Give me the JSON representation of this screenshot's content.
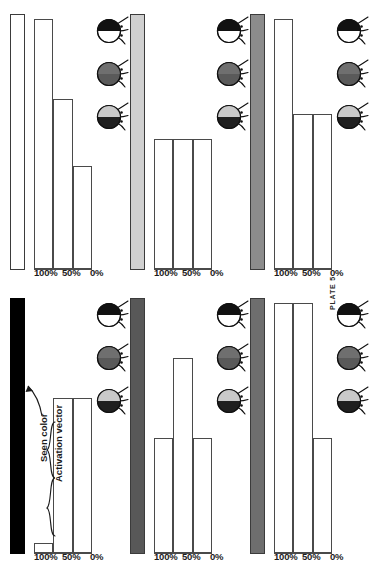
{
  "figure": {
    "caption": "PLATE 5",
    "axis_ticks": [
      "100%",
      "50%",
      "0%"
    ],
    "annotations": {
      "seen_color": "Seen color",
      "activation_vector": "Activation vector"
    },
    "colors": {
      "white": "#ffffff",
      "light_gray": "#d0d0d0",
      "black": "#000000",
      "mid_gray_light": "#8c8c8c",
      "mid_gray_dark": "#6e6e6e",
      "dark_gray": "#585858",
      "outline": "#4a4a4a",
      "bee_dark": "#4a4a4a",
      "bee_mid": "#9a9a9a",
      "bee_light": "#c9c9c9"
    }
  },
  "chart_data": {
    "type": "bar",
    "title": "PLATE 5",
    "xlabel": "",
    "ylabel": "",
    "ylim": [
      0,
      100
    ],
    "grid": false,
    "legend": "none",
    "tick_labels": [
      "100%",
      "50%",
      "0%"
    ],
    "tick_values": [
      100,
      50,
      0
    ],
    "categories": [
      "receptor-1",
      "receptor-2",
      "receptor-3"
    ],
    "panels": [
      {
        "id": "panel-top-left",
        "row": 0,
        "column": 0,
        "seen_color": "#ffffff",
        "seen_color_name": "white",
        "values": [
          100,
          68,
          41
        ],
        "bees": [
          "black-top-white-bottom",
          "dark-gray-uniform",
          "light-top-black-bottom"
        ]
      },
      {
        "id": "panel-top-middle",
        "row": 0,
        "column": 1,
        "seen_color": "#d0d0d0",
        "seen_color_name": "light gray",
        "values": [
          52,
          52,
          52
        ],
        "bees": [
          "black-top-white-bottom",
          "dark-gray-uniform",
          "light-top-black-bottom"
        ]
      },
      {
        "id": "panel-top-right",
        "row": 0,
        "column": 2,
        "seen_color": "#8c8c8c",
        "seen_color_name": "medium gray",
        "values": [
          100,
          62,
          62
        ],
        "bees": [
          "black-top-white-bottom",
          "dark-gray-uniform",
          "light-top-black-bottom"
        ]
      },
      {
        "id": "panel-bottom-left",
        "row": 1,
        "column": 0,
        "seen_color": "#000000",
        "seen_color_name": "black",
        "values": [
          4,
          62,
          62
        ],
        "bees": [
          "black-top-white-bottom",
          "dark-gray-uniform",
          "light-top-black-bottom"
        ]
      },
      {
        "id": "panel-bottom-middle",
        "row": 1,
        "column": 1,
        "seen_color": "#585858",
        "seen_color_name": "dark gray",
        "values": [
          46,
          78,
          46
        ],
        "bees": [
          "black-top-white-bottom",
          "dark-gray-uniform",
          "light-top-black-bottom"
        ]
      },
      {
        "id": "panel-bottom-right",
        "row": 1,
        "column": 2,
        "seen_color": "#6e6e6e",
        "seen_color_name": "medium-dark gray",
        "values": [
          100,
          100,
          46
        ],
        "bees": [
          "black-top-white-bottom",
          "dark-gray-uniform",
          "light-top-black-bottom"
        ]
      }
    ]
  }
}
